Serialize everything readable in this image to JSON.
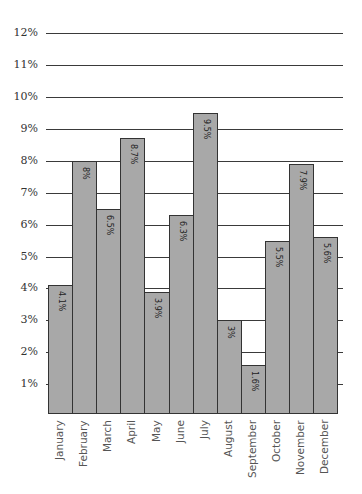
{
  "chart_data": {
    "type": "bar",
    "title": "",
    "xlabel": "",
    "ylabel": "",
    "categories": [
      "January",
      "February",
      "March",
      "April",
      "May",
      "June",
      "July",
      "August",
      "September",
      "October",
      "November",
      "December"
    ],
    "values": [
      4.1,
      8,
      6.5,
      8.7,
      3.9,
      6.3,
      9.5,
      3,
      1.6,
      5.5,
      7.9,
      5.6
    ],
    "data_labels": [
      "4.1%",
      "8%",
      "6.5%",
      "8.7%",
      "3.9%",
      "6.3%",
      "9.5%",
      "3%",
      "1.6%",
      "5.5%",
      "7.9%",
      "5.6%"
    ],
    "yticks": [
      "1%",
      "2%",
      "3%",
      "4%",
      "5%",
      "6%",
      "7%",
      "8%",
      "9%",
      "10%",
      "11%",
      "12%"
    ],
    "ylim": [
      0,
      12
    ],
    "grid": true,
    "legend": null,
    "colors": {
      "bar_fill": "#a8a8a8",
      "bar_edge": "#333333",
      "grid": "#3a3a3a"
    }
  }
}
